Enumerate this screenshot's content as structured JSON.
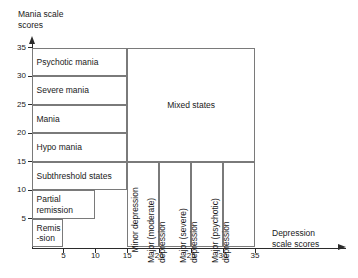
{
  "figure": {
    "title": "",
    "y_axis": {
      "name": "mania-scale",
      "label": "Mania scale\nscores",
      "ticks": [
        35,
        30,
        25,
        20,
        15,
        10,
        5
      ],
      "range": [
        0,
        35
      ]
    },
    "x_axis": {
      "name": "depression-scale",
      "label": "Depression\nscale scores",
      "ticks": [
        5,
        10,
        15,
        20,
        25,
        30,
        35
      ],
      "range": [
        0,
        35
      ]
    },
    "mania_bands": [
      {
        "label": "Psychotic mania",
        "y_from": 30,
        "y_to": 35,
        "x_from": 0,
        "x_to": 15
      },
      {
        "label": "Severe mania",
        "y_from": 25,
        "y_to": 30,
        "x_from": 0,
        "x_to": 15
      },
      {
        "label": "Mania",
        "y_from": 20,
        "y_to": 25,
        "x_from": 0,
        "x_to": 15
      },
      {
        "label": "Hypo mania",
        "y_from": 15,
        "y_to": 20,
        "x_from": 0,
        "x_to": 15
      },
      {
        "label": "Subthreshold states",
        "y_from": 10,
        "y_to": 15,
        "x_from": 0,
        "x_to": 15
      },
      {
        "label": "Partial\nremission",
        "y_from": 5,
        "y_to": 10,
        "x_from": 0,
        "x_to": 10
      },
      {
        "label": "Remis\n-sion",
        "y_from": 0,
        "y_to": 5,
        "x_from": 0,
        "x_to": 5
      }
    ],
    "depression_bands": [
      {
        "label": "Minor depression",
        "x_from": 15,
        "x_to": 20,
        "y_from": 0,
        "y_to": 15
      },
      {
        "label": "Major (moderate)\ndepression",
        "x_from": 20,
        "x_to": 25,
        "y_from": 0,
        "y_to": 15
      },
      {
        "label": "Major (severe)\ndepression",
        "x_from": 25,
        "x_to": 30,
        "y_from": 0,
        "y_to": 15
      },
      {
        "label": "Major (psychotic)\ndepression",
        "x_from": 30,
        "x_to": 35,
        "y_from": 0,
        "y_to": 15
      }
    ],
    "mixed_region": {
      "label": "Mixed states",
      "x_from": 15,
      "x_to": 35,
      "y_from": 15,
      "y_to": 35
    },
    "colors": {
      "axis": "#2b2b2b",
      "cell_border": "#7a7a7a",
      "text": "#1a1a1a",
      "background": "#ffffff"
    }
  },
  "chart_data": {
    "type": "table",
    "xlabel": "Depression scale scores",
    "ylabel": "Mania scale scores",
    "xlim": [
      0,
      35
    ],
    "ylim": [
      0,
      35
    ],
    "xticks": [
      5,
      10,
      15,
      20,
      25,
      30,
      35
    ],
    "yticks": [
      5,
      10,
      15,
      20,
      25,
      30,
      35
    ],
    "grid": false,
    "legend": "none",
    "regions": [
      {
        "name": "Remission",
        "x": [
          0,
          5
        ],
        "y": [
          0,
          5
        ]
      },
      {
        "name": "Partial remission",
        "x": [
          0,
          10
        ],
        "y": [
          5,
          10
        ]
      },
      {
        "name": "Subthreshold states",
        "x": [
          0,
          15
        ],
        "y": [
          10,
          15
        ]
      },
      {
        "name": "Hypo mania",
        "x": [
          0,
          15
        ],
        "y": [
          15,
          20
        ]
      },
      {
        "name": "Mania",
        "x": [
          0,
          15
        ],
        "y": [
          20,
          25
        ]
      },
      {
        "name": "Severe mania",
        "x": [
          0,
          15
        ],
        "y": [
          25,
          30
        ]
      },
      {
        "name": "Psychotic mania",
        "x": [
          0,
          15
        ],
        "y": [
          30,
          35
        ]
      },
      {
        "name": "Minor depression",
        "x": [
          15,
          20
        ],
        "y": [
          0,
          15
        ]
      },
      {
        "name": "Major (moderate) depression",
        "x": [
          20,
          25
        ],
        "y": [
          0,
          15
        ]
      },
      {
        "name": "Major (severe) depression",
        "x": [
          25,
          30
        ],
        "y": [
          0,
          15
        ]
      },
      {
        "name": "Major (psychotic) depression",
        "x": [
          30,
          35
        ],
        "y": [
          0,
          15
        ]
      },
      {
        "name": "Mixed states",
        "x": [
          15,
          35
        ],
        "y": [
          15,
          35
        ]
      }
    ]
  }
}
